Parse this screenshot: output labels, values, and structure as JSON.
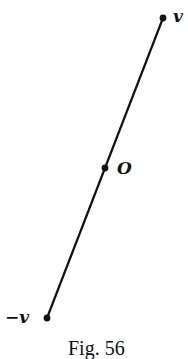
{
  "figure": {
    "caption": "Fig. 56",
    "points": [
      {
        "id": "v",
        "label": "v",
        "x": 163,
        "y": 18
      },
      {
        "id": "O",
        "label": "O",
        "x": 105,
        "y": 168
      },
      {
        "id": "neg_v",
        "label": "−v",
        "x": 47,
        "y": 318
      }
    ],
    "line": {
      "x1": 163,
      "y1": 18,
      "x2": 47,
      "y2": 318
    },
    "colors": {
      "ink": "#111111",
      "background": "#ffffff"
    }
  }
}
